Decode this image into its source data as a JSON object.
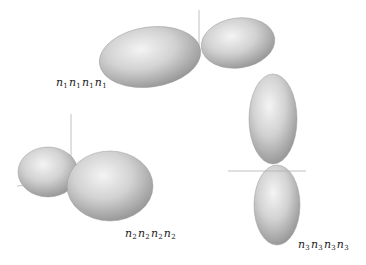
{
  "figure": {
    "panels": [
      {
        "id": "panel-1",
        "label_base": "n",
        "label_index": "1",
        "label_repeat": 4,
        "label_text": "n1n1n1n1",
        "label_pos": {
          "x": 56,
          "y": 76
        },
        "lobes": [
          {
            "cx": 150,
            "cy": 57,
            "rx": 51,
            "ry": 30,
            "rot": -8
          },
          {
            "cx": 238,
            "cy": 43,
            "rx": 37,
            "ry": 25,
            "rot": -8
          }
        ],
        "axis": {
          "x1": 199,
          "y1": 10,
          "x2": 199,
          "y2": 46
        }
      },
      {
        "id": "panel-2",
        "label_base": "n",
        "label_index": "2",
        "label_repeat": 4,
        "label_text": "n2n2n2n2",
        "label_pos": {
          "x": 125,
          "y": 227
        },
        "lobes": [
          {
            "cx": 48,
            "cy": 172,
            "rx": 30,
            "ry": 25,
            "rot": 0
          },
          {
            "cx": 110,
            "cy": 186,
            "rx": 43,
            "ry": 35,
            "rot": 0
          }
        ],
        "axis": {
          "x1": 71,
          "y1": 114,
          "x2": 71,
          "y2": 168
        },
        "axis_h": {
          "x1": 17,
          "y1": 186,
          "x2": 28,
          "y2": 185
        }
      },
      {
        "id": "panel-3",
        "label_base": "n",
        "label_index": "3",
        "label_repeat": 4,
        "label_text": "n3n3n3n3",
        "label_pos": {
          "x": 298,
          "y": 238
        },
        "lobes": [
          {
            "cx": 273,
            "cy": 119,
            "rx": 24,
            "ry": 45,
            "rot": 0
          },
          {
            "cx": 277,
            "cy": 205,
            "rx": 23,
            "ry": 40,
            "rot": 0
          }
        ],
        "axis_h": {
          "x1": 228,
          "y1": 171,
          "x2": 306,
          "y2": 171
        }
      }
    ],
    "colors": {
      "lobe_light": "#f2f2f2",
      "lobe_mid": "#c8c8c8",
      "lobe_dark": "#8a8a8a",
      "axis": "#b0b0b0",
      "label": "#222222"
    }
  }
}
